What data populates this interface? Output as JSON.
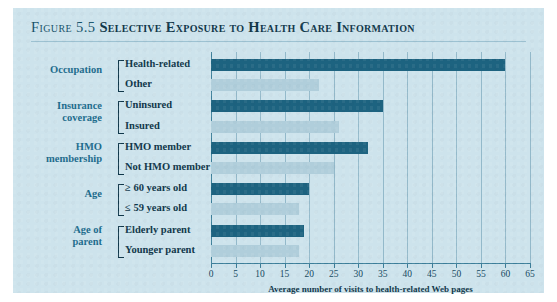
{
  "figure": {
    "number_label": "Figure 5.5",
    "title": "Selective Exposure to Health Care Information"
  },
  "colors": {
    "panel_background": "#cde3ec",
    "bar_dark": "#1d6380",
    "bar_light": "#b0cedb",
    "group_label": "#1d6c8c",
    "text": "#10374a",
    "axis": "#3c7e99"
  },
  "chart_data": {
    "type": "bar",
    "orientation": "horizontal",
    "title": "Selective Exposure to Health Care Information",
    "xlabel": "Average number of visits to health-related Web pages",
    "ylabel": "",
    "xlim": [
      0,
      65
    ],
    "xticks": [
      0,
      5,
      10,
      15,
      20,
      25,
      30,
      35,
      40,
      45,
      50,
      55,
      60,
      65
    ],
    "grid": true,
    "legend": "none",
    "groups": [
      {
        "name": "Occupation",
        "bars": [
          {
            "label": "Health-related",
            "value": 60,
            "shade": "dark"
          },
          {
            "label": "Other",
            "value": 22,
            "shade": "light"
          }
        ]
      },
      {
        "name": "Insurance coverage",
        "bars": [
          {
            "label": "Uninsured",
            "value": 35,
            "shade": "dark"
          },
          {
            "label": "Insured",
            "value": 26,
            "shade": "light"
          }
        ]
      },
      {
        "name": "HMO membership",
        "bars": [
          {
            "label": "HMO member",
            "value": 32,
            "shade": "dark"
          },
          {
            "label": "Not HMO member",
            "value": 25,
            "shade": "light"
          }
        ]
      },
      {
        "name": "Age",
        "bars": [
          {
            "label": "≥ 60 years old",
            "value": 20,
            "shade": "dark"
          },
          {
            "label": "≤ 59 years old",
            "value": 18,
            "shade": "light"
          }
        ]
      },
      {
        "name": "Age of parent",
        "bars": [
          {
            "label": "Elderly parent",
            "value": 19,
            "shade": "dark"
          },
          {
            "label": "Younger parent",
            "value": 18,
            "shade": "light"
          }
        ]
      }
    ]
  }
}
